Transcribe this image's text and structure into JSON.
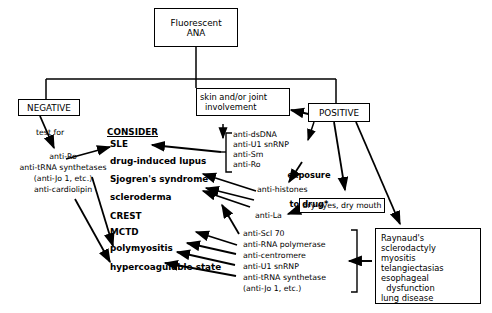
{
  "diagram": {
    "nodes": {
      "fluorescent_ana": "Fluorescent\nANA",
      "fluorescent_ana_line1": "Fluorescent",
      "fluorescent_ana_line2": "ANA",
      "negative": "NEGATIVE",
      "positive": "POSITIVE",
      "skin_joint_line1": "skin and/or joint",
      "skin_joint_line2": "involvement",
      "dry_eyes_dry_mouth": "dry eyes, dry mouth",
      "test_for": "test for",
      "consider": "CONSIDER",
      "exposure_line1": "exposure",
      "exposure_line2": "to drug*",
      "anti_histones": "anti-histones",
      "anti_la": "anti-La"
    },
    "negative_tests": [
      "anti-Ro",
      "anti-tRNA synthetases",
      "(anti-Jo 1, etc.)",
      "anti-cardiolipin"
    ],
    "consider_list": [
      "SLE",
      "drug-induced lupus",
      "Sjogren's syndrome",
      "scleroderma",
      "CREST",
      "MCTD",
      "polymyositis",
      "hypercoagulable state"
    ],
    "sle_antibodies": [
      "anti-dsDNA",
      "anti-U1 snRNP",
      "anti-Sm",
      "anti-Ro"
    ],
    "scleroderma_antibodies": [
      "anti-Scl 70",
      "anti-RNA polymerase",
      "anti-centromere",
      "anti-U1 snRNP",
      "anti-tRNA synthetase",
      "(anti-Jo 1, etc.)"
    ],
    "clinical_features": [
      "Raynaud's",
      "sclerodactyly",
      "myositis",
      "telangiectasias",
      "esophageal",
      "  dysfunction",
      "lung disease"
    ],
    "colors": {
      "line": "#000000",
      "background": "#ffffff",
      "text": "#000000"
    }
  }
}
